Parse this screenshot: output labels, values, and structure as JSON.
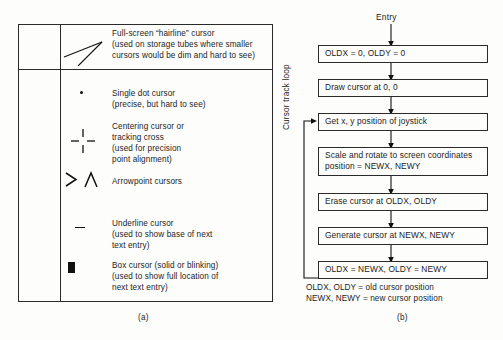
{
  "figure": {
    "panel_a_label": "(a)",
    "panel_b_label": "(b)"
  },
  "cursor_table": {
    "rows": [
      {
        "symbol": "hairline-cursor-symbol",
        "description": "Full-screen “hairline” cursor\n(used on storage tubes where smaller\ncursors would be dim and hard to see)"
      },
      {
        "symbol": "single-dot-cursor-symbol",
        "description": "Single dot cursor\n(precise, but hard to see)"
      },
      {
        "symbol": "centering-cross-cursor-symbol",
        "description": "Centering cursor or\ntracking cross\n(used for precision\npoint alignment)"
      },
      {
        "symbol": "arrowpoint-cursor-symbol",
        "description": "Arrowpoint cursors"
      },
      {
        "symbol": "underline-cursor-symbol",
        "description": "Underline cursor\n(used to show base of next\ntext entry)"
      },
      {
        "symbol": "box-cursor-symbol",
        "description": "Box cursor (solid or blinking)\n(used to show full location of\nnext text entry)"
      }
    ]
  },
  "flowchart": {
    "entry_label": "Entry",
    "loop_label": "Cursor track loop",
    "steps": [
      "OLDX = 0, OLDY = 0",
      "Draw cursor at 0, 0",
      "Get x, y position of joystick",
      "Scale and rotate to screen coordinates\nposition = NEWX, NEWY",
      "Erase cursor at OLDX, OLDY",
      "Generate cursor at NEWX, NEWY",
      "OLDX = NEWX, OLDY = NEWY"
    ],
    "legend": "OLDX, OLDY = old cursor position\nNEWX, NEWY = new cursor position"
  }
}
